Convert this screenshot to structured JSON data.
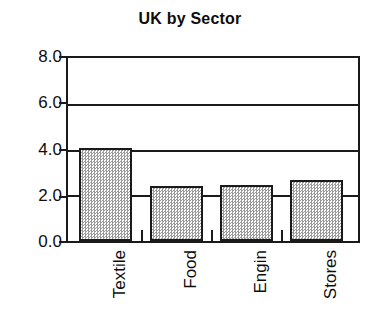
{
  "chart_data": {
    "type": "bar",
    "title": "UK by Sector",
    "subtitle": "",
    "xlabel": "",
    "ylabel": "",
    "categories": [
      "Textile",
      "Food",
      "Engin",
      "Stores"
    ],
    "values": [
      4.05,
      2.4,
      2.45,
      2.65
    ],
    "ylim": [
      0.0,
      8.0
    ],
    "yticks": [
      0.0,
      2.0,
      4.0,
      6.0,
      8.0
    ],
    "ytick_labels": [
      "0.0",
      "2.0",
      "4.0",
      "6.0",
      "8.0"
    ],
    "grid": true,
    "grid_axis": "y",
    "legend": false,
    "legend_position": "none",
    "series": [
      {
        "name": "UK by Sector",
        "values": [
          4.05,
          2.4,
          2.45,
          2.65
        ]
      }
    ],
    "bar_fill": "#d9d9d9",
    "bar_edge": "#1a1a1a",
    "frame_color": "#1a1a1a",
    "background": "#ffffff",
    "text_color": "#0d0d0d"
  },
  "axis": {
    "y_labels": [
      {
        "text": "8.0",
        "value": 8.0
      },
      {
        "text": "6.0",
        "value": 6.0
      },
      {
        "text": "4.0",
        "value": 4.0
      },
      {
        "text": "2.0",
        "value": 2.0
      },
      {
        "text": "0.0",
        "value": 0.0
      }
    ],
    "x_labels": [
      {
        "text": "Textile"
      },
      {
        "text": "Food"
      },
      {
        "text": "Engin"
      },
      {
        "text": "Stores"
      }
    ]
  }
}
